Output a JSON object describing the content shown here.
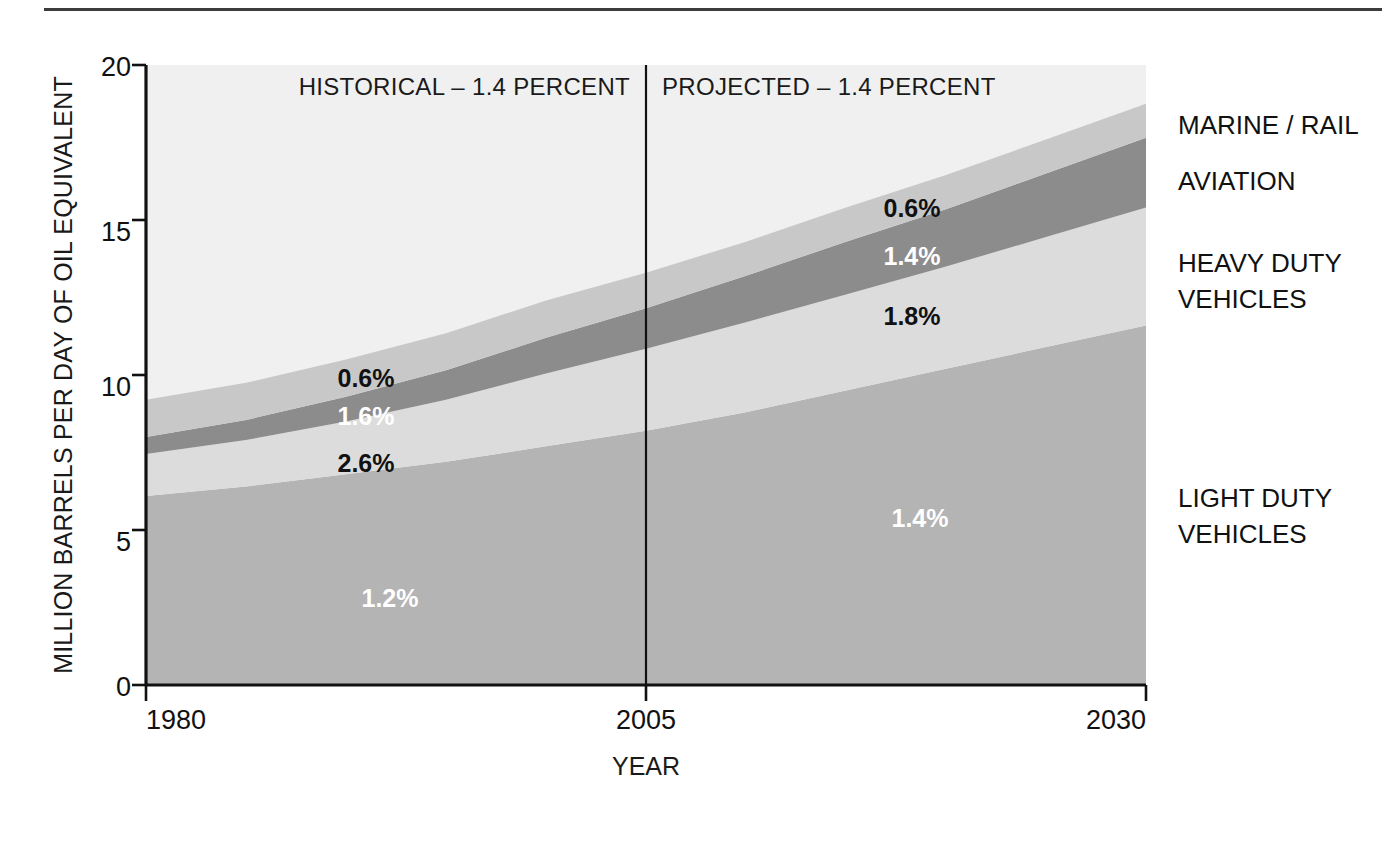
{
  "chart_data": {
    "type": "area",
    "title": "",
    "subtitle": "",
    "xlabel": "YEAR",
    "ylabel": "MILLION BARRELS PER DAY OF OIL EQUIVALENT",
    "xlim": [
      1980,
      2030
    ],
    "ylim": [
      0,
      20
    ],
    "xticks": [
      "1980",
      "2005",
      "2030"
    ],
    "xtick_values": [
      1980,
      2005,
      2030
    ],
    "yticks": [
      "0",
      "5",
      "10",
      "15",
      "20"
    ],
    "ytick_values": [
      0,
      5,
      10,
      15,
      20
    ],
    "grid": false,
    "legend_position": "right-outside",
    "stacked": true,
    "x": [
      1980,
      1985,
      1990,
      1995,
      2000,
      2005,
      2010,
      2015,
      2020,
      2025,
      2030
    ],
    "series": [
      {
        "name": "LIGHT DUTY VEHICLES",
        "color": "#b4b4b4",
        "growth_label": "1.2%",
        "projected_growth_label": "1.4%",
        "values": [
          6.1,
          6.4,
          6.8,
          7.2,
          7.7,
          8.2,
          8.8,
          9.5,
          10.2,
          10.9,
          11.6
        ]
      },
      {
        "name": "HEAVY DUTY VEHICLES",
        "color": "#dcdcdc",
        "growth_label": "2.6%",
        "projected_growth_label": "1.8%",
        "values": [
          1.35,
          1.5,
          1.7,
          2.0,
          2.35,
          2.65,
          2.9,
          3.1,
          3.3,
          3.55,
          3.8
        ]
      },
      {
        "name": "AVIATION",
        "color": "#8c8c8c",
        "growth_label": "1.6%",
        "projected_growth_label": "1.4%",
        "values": [
          0.55,
          0.65,
          0.8,
          0.95,
          1.15,
          1.3,
          1.5,
          1.7,
          1.85,
          2.05,
          2.25
        ]
      },
      {
        "name": "MARINE / RAIL",
        "color": "#c8c8c8",
        "growth_label": "0.6%",
        "projected_growth_label": "0.6%",
        "values": [
          1.2,
          1.2,
          1.2,
          1.2,
          1.2,
          1.15,
          1.1,
          1.1,
          1.1,
          1.1,
          1.1
        ]
      }
    ],
    "annotations": {
      "historical_header": "HISTORICAL – 1.4 PERCENT",
      "projected_header": "PROJECTED – 1.4 PERCENT",
      "divider_year": 2005,
      "historical_percent_labels": [
        {
          "text": "0.6%",
          "series": "MARINE / RAIL",
          "style": "dark"
        },
        {
          "text": "1.6%",
          "series": "AVIATION",
          "style": "light"
        },
        {
          "text": "2.6%",
          "series": "HEAVY DUTY VEHICLES",
          "style": "dark"
        },
        {
          "text": "1.2%",
          "series": "LIGHT DUTY VEHICLES",
          "style": "light"
        }
      ],
      "projected_percent_labels": [
        {
          "text": "0.6%",
          "series": "MARINE / RAIL",
          "style": "dark"
        },
        {
          "text": "1.4%",
          "series": "AVIATION",
          "style": "light"
        },
        {
          "text": "1.8%",
          "series": "HEAVY DUTY VEHICLES",
          "style": "dark"
        },
        {
          "text": "1.4%",
          "series": "LIGHT DUTY VEHICLES",
          "style": "light"
        }
      ]
    },
    "right_labels": [
      "MARINE / RAIL",
      "AVIATION",
      "HEAVY DUTY\nVEHICLES",
      "LIGHT DUTY\nVEHICLES"
    ]
  },
  "axis": {
    "y_title": "MILLION BARRELS PER DAY OF OIL EQUIVALENT",
    "x_title": "YEAR",
    "y_tick_20": "20",
    "y_tick_15": "15",
    "y_tick_10": "10",
    "y_tick_5": "5",
    "y_tick_0": "0",
    "x_tick_1980": "1980",
    "x_tick_2005": "2005",
    "x_tick_2030": "2030"
  },
  "headers": {
    "historical": "HISTORICAL – 1.4 PERCENT",
    "projected": "PROJECTED – 1.4 PERCENT"
  },
  "legend": {
    "marine_rail": "MARINE / RAIL",
    "aviation": "AVIATION",
    "heavy_duty_line1": "HEAVY DUTY",
    "heavy_duty_line2": "VEHICLES",
    "light_duty_line1": "LIGHT DUTY",
    "light_duty_line2": "VEHICLES"
  },
  "percent_labels": {
    "hist_marine": "0.6%",
    "hist_aviation": "1.6%",
    "hist_heavy": "2.6%",
    "hist_light": "1.2%",
    "proj_marine": "0.6%",
    "proj_aviation": "1.4%",
    "proj_heavy": "1.8%",
    "proj_light": "1.4%"
  },
  "colors": {
    "marine_rail": "#c8c8c8",
    "aviation": "#8c8c8c",
    "heavy_duty": "#dcdcdc",
    "light_duty": "#b4b4b4",
    "plot_background": "#f0f0f0",
    "axis": "#111111",
    "rule": "#3c3c3c"
  }
}
